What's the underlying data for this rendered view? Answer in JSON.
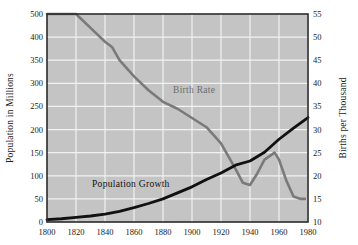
{
  "chart_data": {
    "type": "line",
    "title": "",
    "xlabel": "",
    "grid": true,
    "legend_position": "inline-annotations",
    "x": [
      1800,
      1820,
      1840,
      1860,
      1880,
      1900,
      1920,
      1940,
      1960,
      1980
    ],
    "x_tick_labels": [
      "1800",
      "1820",
      "1840",
      "1860",
      "1880",
      "1900",
      "1920",
      "1940",
      "1960",
      "1980"
    ],
    "xlim": [
      1800,
      1980
    ],
    "left_axis": {
      "label": "Population in Millions",
      "tick_labels": [
        "0",
        "50",
        "100",
        "150",
        "200",
        "250",
        "300",
        "350",
        "400",
        "500"
      ],
      "tick_values": [
        0,
        50,
        100,
        150,
        200,
        250,
        300,
        350,
        400,
        500
      ],
      "lim": [
        0,
        450
      ]
    },
    "right_axis": {
      "label": "Births per Thousand",
      "tick_labels": [
        "10",
        "15",
        "20",
        "25",
        "30",
        "35",
        "40",
        "45",
        "50",
        "55"
      ],
      "tick_values": [
        10,
        15,
        20,
        25,
        30,
        35,
        40,
        45,
        50,
        55
      ],
      "lim": [
        10,
        55
      ]
    },
    "series": [
      {
        "name": "Birth Rate",
        "axis": "right",
        "color": "#7a7a7a",
        "unit": "births per thousand",
        "label_text": "Birth Rate",
        "points": [
          {
            "x": 1800,
            "y": 55.0
          },
          {
            "x": 1810,
            "y": 55.0
          },
          {
            "x": 1820,
            "y": 55.0
          },
          {
            "x": 1830,
            "y": 52.0
          },
          {
            "x": 1840,
            "y": 49.0
          },
          {
            "x": 1845,
            "y": 47.8
          },
          {
            "x": 1850,
            "y": 45.0
          },
          {
            "x": 1860,
            "y": 41.5
          },
          {
            "x": 1870,
            "y": 38.5
          },
          {
            "x": 1880,
            "y": 36.0
          },
          {
            "x": 1890,
            "y": 34.5
          },
          {
            "x": 1900,
            "y": 32.5
          },
          {
            "x": 1910,
            "y": 30.5
          },
          {
            "x": 1920,
            "y": 27.0
          },
          {
            "x": 1930,
            "y": 21.5
          },
          {
            "x": 1935,
            "y": 18.5
          },
          {
            "x": 1940,
            "y": 18.0
          },
          {
            "x": 1945,
            "y": 20.5
          },
          {
            "x": 1950,
            "y": 23.5
          },
          {
            "x": 1957,
            "y": 25.0
          },
          {
            "x": 1960,
            "y": 23.5
          },
          {
            "x": 1965,
            "y": 19.0
          },
          {
            "x": 1970,
            "y": 15.5
          },
          {
            "x": 1975,
            "y": 15.0
          },
          {
            "x": 1978,
            "y": 15.0
          }
        ]
      },
      {
        "name": "Population Growth",
        "axis": "left",
        "color": "#111111",
        "unit": "millions",
        "label_text": "Population Growth",
        "points": [
          {
            "x": 1800,
            "y": 5
          },
          {
            "x": 1810,
            "y": 7
          },
          {
            "x": 1820,
            "y": 10
          },
          {
            "x": 1830,
            "y": 13
          },
          {
            "x": 1840,
            "y": 17
          },
          {
            "x": 1850,
            "y": 23
          },
          {
            "x": 1860,
            "y": 31
          },
          {
            "x": 1870,
            "y": 40
          },
          {
            "x": 1880,
            "y": 50
          },
          {
            "x": 1890,
            "y": 63
          },
          {
            "x": 1900,
            "y": 76
          },
          {
            "x": 1910,
            "y": 92
          },
          {
            "x": 1920,
            "y": 106
          },
          {
            "x": 1930,
            "y": 123
          },
          {
            "x": 1940,
            "y": 132
          },
          {
            "x": 1950,
            "y": 151
          },
          {
            "x": 1960,
            "y": 179
          },
          {
            "x": 1970,
            "y": 203
          },
          {
            "x": 1980,
            "y": 226
          }
        ]
      }
    ],
    "colors": {
      "plot_background": "#c4c4c4",
      "gridline": "#f2f2f2",
      "frame": "#2b2b2b",
      "birth_rate": "#7a7a7a",
      "population_growth": "#111111",
      "page_background": "#ffffff"
    }
  }
}
